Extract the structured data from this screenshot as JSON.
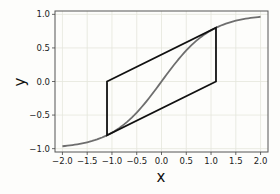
{
  "chart_data": {
    "type": "line",
    "title": "",
    "xlabel": "x",
    "ylabel": "y",
    "xlim": [
      -2.15,
      2.15
    ],
    "ylim": [
      -1.05,
      1.05
    ],
    "grid": true,
    "xticks": [
      "-2.0",
      "-1.5",
      "-1.0",
      "-0.5",
      "0.0",
      "0.5",
      "1.0",
      "1.5",
      "2.0"
    ],
    "xtick_values": [
      -2.0,
      -1.5,
      -1.0,
      -0.5,
      0.0,
      0.5,
      1.0,
      1.5,
      2.0
    ],
    "yticks": [
      "-1.0",
      "-0.5",
      "0.0",
      "0.5",
      "1.0"
    ],
    "ytick_values": [
      -1.0,
      -0.5,
      0.0,
      0.5,
      1.0
    ],
    "series": [
      {
        "name": "tanh curve",
        "color": "#6e6e6e",
        "function": "tanh(x)",
        "x": [
          -2.0,
          -1.5,
          -1.0,
          -0.5,
          0.0,
          0.5,
          1.0,
          1.5,
          2.0
        ],
        "y": [
          -0.964,
          -0.905,
          -0.762,
          -0.462,
          0.0,
          0.462,
          0.762,
          0.905,
          0.964
        ]
      },
      {
        "name": "parallelogram",
        "color": "#111111",
        "closed": true,
        "x": [
          -1.1,
          -1.1,
          1.1,
          1.1
        ],
        "y": [
          0.0,
          -0.8,
          0.0,
          0.8
        ]
      }
    ],
    "legend": null
  }
}
